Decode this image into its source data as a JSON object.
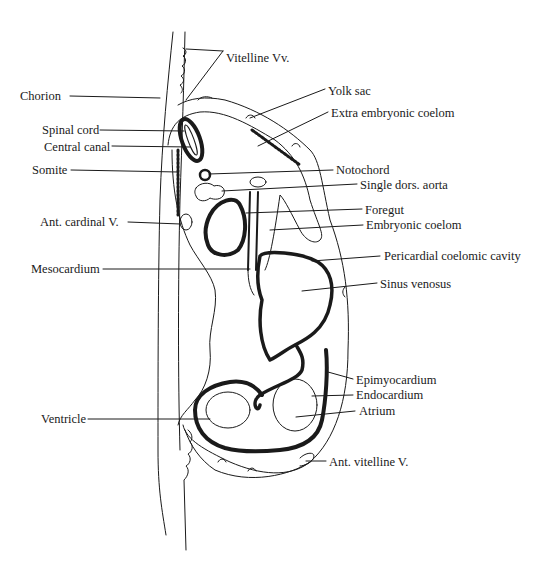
{
  "diagram": {
    "ink_color": "#1a1a1a",
    "background": "#ffffff",
    "labels_left": [
      {
        "id": "chorion",
        "text": "Chorion",
        "x": 20,
        "y": 91
      },
      {
        "id": "spinal-cord",
        "text": "Spinal cord",
        "x": 42,
        "y": 122
      },
      {
        "id": "central-canal",
        "text": "Central canal",
        "x": 44,
        "y": 140
      },
      {
        "id": "somite",
        "text": "Somite",
        "x": 32,
        "y": 163
      },
      {
        "id": "ant-cardinal-v",
        "text": "Ant. cardinal V.",
        "x": 40,
        "y": 215
      },
      {
        "id": "mesocardium",
        "text": "Mesocardium",
        "x": 31,
        "y": 263
      },
      {
        "id": "ventricle",
        "text": "Ventricle",
        "x": 41,
        "y": 413
      }
    ],
    "labels_right": [
      {
        "id": "vitelline-vv",
        "text": "Vitelline Vv.",
        "x": 226,
        "y": 51
      },
      {
        "id": "yolk-sac",
        "text": "Yolk sac",
        "x": 328,
        "y": 85
      },
      {
        "id": "extra-embryonic-coelom",
        "text": "Extra embryonic coelom",
        "x": 331,
        "y": 106
      },
      {
        "id": "notochord",
        "text": "Notochord",
        "x": 336,
        "y": 163
      },
      {
        "id": "single-dors-aorta",
        "text": "Single dors. aorta",
        "x": 360,
        "y": 178
      },
      {
        "id": "foregut",
        "text": "Foregut",
        "x": 365,
        "y": 203
      },
      {
        "id": "embryonic-coelom",
        "text": "Embryonic coelom",
        "x": 366,
        "y": 218
      },
      {
        "id": "pericardial-coelomic-cavity",
        "text": "Pericardial coelomic cavity",
        "x": 384,
        "y": 250
      },
      {
        "id": "sinus-venosus",
        "text": "Sinus venosus",
        "x": 380,
        "y": 277
      },
      {
        "id": "epimyocardium",
        "text": "Epimyocardium",
        "x": 356,
        "y": 373
      },
      {
        "id": "endocardium",
        "text": "Endocardium",
        "x": 356,
        "y": 388
      },
      {
        "id": "atrium",
        "text": "Atrium",
        "x": 359,
        "y": 404
      },
      {
        "id": "ant-vitelline-v",
        "text": "Ant. vitelline V.",
        "x": 329,
        "y": 456
      }
    ]
  }
}
